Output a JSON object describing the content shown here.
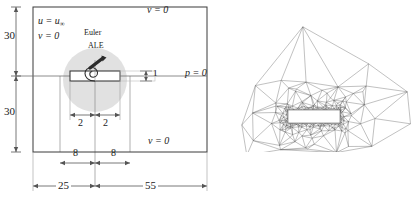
{
  "figure": {
    "left_panel": {
      "name": "computational-domain-schematic",
      "boundary_conditions": {
        "top": "v = 0",
        "bottom": "v = 0",
        "inlet_line1": "u = u",
        "inlet_line1_sub": "∞",
        "inlet_line2": "v = 0",
        "outlet": "p = 0"
      },
      "region_labels": {
        "outer": "Euler",
        "inner": "ALE"
      },
      "dimensions": {
        "thickness": "1",
        "plate_half_left": "2",
        "plate_half_right": "2",
        "box_above": "30",
        "box_below": "30",
        "inner_left": "8",
        "inner_right": "8",
        "upstream": "25",
        "downstream": "55"
      }
    },
    "right_panel": {
      "name": "unstructured-triangular-mesh"
    },
    "colors": {
      "line": "#3a3a3a",
      "dim_line": "#555555",
      "ale_zone": "#c9c9c9",
      "mesh": "#4a4a4a",
      "plate_fill": "#ffffff"
    }
  }
}
